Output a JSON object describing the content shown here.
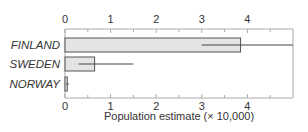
{
  "chart_data": {
    "type": "bar",
    "orientation": "horizontal",
    "title": "",
    "xlabel": "Population estimate (× 10,000)",
    "ylabel": "",
    "xlim": [
      0,
      5
    ],
    "x_ticks": [
      0,
      1,
      2,
      3,
      4
    ],
    "x_minor_ticks": [
      0.5,
      1.5,
      2.5,
      3.5,
      4.5
    ],
    "grid": false,
    "legend": null,
    "categories": [
      "FINLAND",
      "SWEDEN",
      "NORWAY"
    ],
    "values": [
      3.85,
      0.65,
      0.05
    ],
    "error_bars": [
      {
        "low": 3.0,
        "high": 5.0
      },
      {
        "low": 0.3,
        "high": 1.5
      },
      {
        "low": 0.03,
        "high": 0.08
      }
    ],
    "axis_positions": [
      "top",
      "bottom"
    ],
    "colors": {
      "bar_fill": "#e4e4e4",
      "bar_stroke": "#555555",
      "error_bar": "#444444",
      "axis": "#aaaaaa",
      "text": "#333333"
    }
  }
}
